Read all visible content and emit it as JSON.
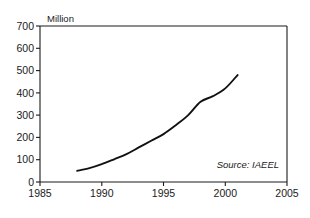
{
  "chart_data": {
    "type": "line",
    "title": "",
    "subtitle": "",
    "xlabel": "",
    "ylabel": "Million",
    "ylabel_position": "above-axis",
    "xlim": [
      1985,
      2005
    ],
    "ylim": [
      0,
      700
    ],
    "grid": false,
    "legend": false,
    "annotations": [
      {
        "name": "source-note",
        "text": "Source: IAEEL",
        "style": "italic",
        "position": "inside-bottom-right"
      }
    ],
    "x_ticks": [
      1985,
      1990,
      1995,
      2000,
      2005
    ],
    "x_tick_labels": [
      "1985",
      "1990",
      "1995",
      "2000",
      "2005"
    ],
    "y_ticks": [
      0,
      100,
      200,
      300,
      400,
      500,
      600,
      700
    ],
    "y_tick_labels": [
      "0",
      "100",
      "200",
      "300",
      "400",
      "500",
      "600",
      "700"
    ],
    "series": [
      {
        "name": "Units",
        "color": "#111111",
        "x": [
          1988,
          1989,
          1990,
          1991,
          1992,
          1993,
          1994,
          1995,
          1996,
          1997,
          1998,
          1999,
          2000,
          2001
        ],
        "values": [
          50,
          62,
          80,
          102,
          125,
          155,
          185,
          215,
          255,
          300,
          360,
          385,
          420,
          480
        ]
      }
    ]
  },
  "figure": {
    "axis_label": "Million",
    "source_note": "Source: IAEEL",
    "background_color": "#ffffff",
    "line_color": "#111111",
    "axis_color": "#1a1a1a"
  }
}
